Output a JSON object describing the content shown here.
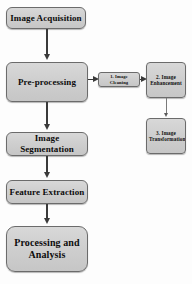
{
  "diagram": {
    "background_color": "#fdfdfd",
    "node_fill_color": "#cfcfcf",
    "node_border_color": "#6b6b6b",
    "connector_color": "#3a3a3a",
    "main_pipeline": [
      {
        "id": "acquisition",
        "label": "Image Acquisition"
      },
      {
        "id": "preprocessing",
        "label": "Pre-processing"
      },
      {
        "id": "segmentation",
        "label": "Image Segmentation"
      },
      {
        "id": "feature",
        "label": "Feature Extraction"
      },
      {
        "id": "processing",
        "label_line1": "Processing and",
        "label_line2": "Analysis"
      }
    ],
    "branch": [
      {
        "id": "cleaning",
        "label": "1. Image Cleaning"
      },
      {
        "id": "enhancement",
        "label_line1": "2. Image",
        "label_line2": "Enhancement"
      },
      {
        "id": "transformation",
        "label_line1": "3. Image",
        "label_line2": "Transformation"
      }
    ]
  }
}
